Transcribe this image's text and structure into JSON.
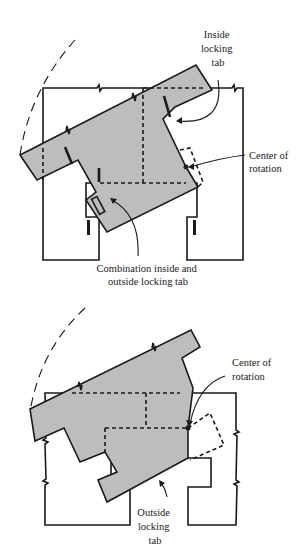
{
  "figure": {
    "top_diagram": {
      "labels": {
        "inside_tab": [
          "Inside",
          "locking",
          "tab"
        ],
        "center": [
          "Center of",
          "rotation"
        ],
        "combination": [
          "Combination inside and",
          "outside locking tab"
        ]
      }
    },
    "bottom_diagram": {
      "labels": {
        "center": [
          "Center of",
          "rotation"
        ],
        "outside_tab": [
          "Outside",
          "locking",
          "tab"
        ]
      }
    },
    "colors": {
      "piece_fill": "#bdbdbd",
      "stroke": "#1a1a1a",
      "background": "#ffffff"
    }
  }
}
